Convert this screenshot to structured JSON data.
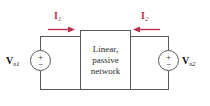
{
  "diagram": {
    "network_box": {
      "lines": [
        "Linear,",
        "passive",
        "network"
      ]
    },
    "sources": [
      {
        "id": "left",
        "label_main": "V",
        "label_sub": "s1",
        "polarity_top": "+",
        "polarity_bottom": "−"
      },
      {
        "id": "right",
        "label_main": "V",
        "label_sub": "s2",
        "polarity_top": "+",
        "polarity_bottom": "−"
      }
    ],
    "currents": [
      {
        "id": "I1",
        "label_main": "I",
        "label_sub": "1",
        "direction": "right",
        "color": "#c0304c"
      },
      {
        "id": "I2",
        "label_main": "I",
        "label_sub": "2",
        "direction": "left",
        "color": "#c0304c"
      }
    ],
    "colors": {
      "wire": "#5a5a5a",
      "text": "#2b2b2b",
      "current_accent": "#c0304c",
      "background": "#ffffff"
    }
  }
}
